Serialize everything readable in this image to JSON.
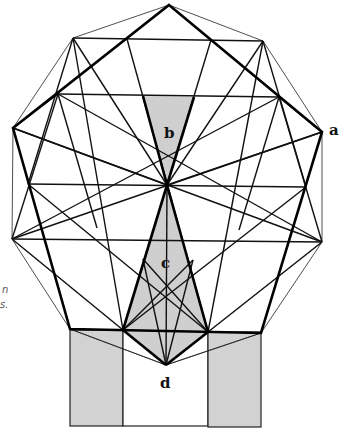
{
  "figure": {
    "labels": {
      "a": "a",
      "b": "b",
      "c": "c",
      "d": "d"
    },
    "caption_fragments": [
      "n",
      "s."
    ],
    "colors": {
      "line": "#000000",
      "shade": "#cfcfcf",
      "background": "#ffffff"
    },
    "vertices": {
      "V0": [
        169,
        5
      ],
      "V1": [
        263,
        41
      ],
      "V2": [
        322,
        132
      ],
      "V3": [
        322,
        242
      ],
      "V4": [
        261,
        333
      ],
      "V5": [
        166,
        365
      ],
      "V6": [
        70,
        329
      ],
      "V7": [
        12,
        239
      ],
      "V8": [
        13,
        128
      ],
      "V9": [
        73,
        38
      ],
      "center": [
        167,
        185
      ]
    },
    "regions": {
      "b": "shaded triangle below top horizontal, apex at center",
      "c": "shaded kite from center down to point d",
      "d": "white square below bottom edge, flanked by two shaded rectangles"
    }
  }
}
